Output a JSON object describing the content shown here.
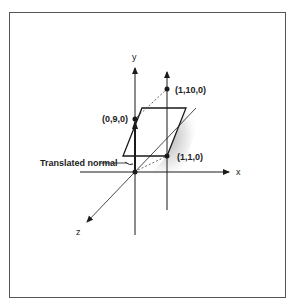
{
  "figure": {
    "axes": {
      "x_label": "x",
      "y_label": "y",
      "z_label": "z"
    },
    "points": [
      {
        "label": "(0,9,0)",
        "x": 135,
        "y": 119
      },
      {
        "label": "(1,10,0)",
        "x": 167,
        "y": 89
      },
      {
        "label": "(1,1,0)",
        "x": 167,
        "y": 156
      }
    ],
    "callout": {
      "label": "Translated normal"
    },
    "colors": {
      "ink": "#1a1a1a",
      "frame": "#555555",
      "background": "#ffffff"
    }
  }
}
